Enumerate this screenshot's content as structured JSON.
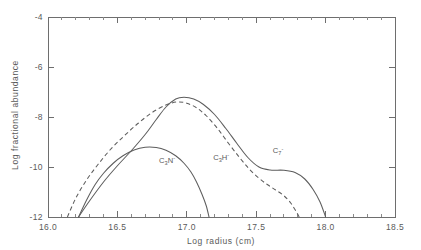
{
  "chart_data": {
    "type": "line",
    "title": "",
    "xlabel": "Log radius (cm)",
    "ylabel": "Log fractional abundance",
    "xlim": [
      16.0,
      18.5
    ],
    "ylim": [
      -12,
      -4
    ],
    "xticks": [
      "16.0",
      "16.5",
      "17.0",
      "17.5",
      "18.0",
      "18.5"
    ],
    "xtick_values": [
      16.0,
      16.5,
      17.0,
      17.5,
      18.0,
      18.5
    ],
    "yticks": [
      "-4",
      "-6",
      "-8",
      "-10",
      "-12"
    ],
    "ytick_values": [
      -4,
      -6,
      -8,
      -10,
      -12
    ],
    "grid": false,
    "legend_position": "inline-annotations",
    "series": [
      {
        "name": "C7-",
        "label_base": "C",
        "label_sub": "7",
        "label_sup": "-",
        "style": "solid",
        "color": "#5d5d5d",
        "annotation_x": 17.62,
        "annotation_y": -9.45,
        "points": [
          [
            16.22,
            -12.0
          ],
          [
            16.3,
            -11.35
          ],
          [
            16.4,
            -10.6
          ],
          [
            16.5,
            -9.95
          ],
          [
            16.6,
            -9.35
          ],
          [
            16.7,
            -8.7
          ],
          [
            16.78,
            -8.1
          ],
          [
            16.85,
            -7.6
          ],
          [
            16.92,
            -7.28
          ],
          [
            16.98,
            -7.21
          ],
          [
            17.05,
            -7.28
          ],
          [
            17.12,
            -7.5
          ],
          [
            17.2,
            -7.9
          ],
          [
            17.28,
            -8.45
          ],
          [
            17.36,
            -9.05
          ],
          [
            17.44,
            -9.62
          ],
          [
            17.52,
            -10.0
          ],
          [
            17.6,
            -10.12
          ],
          [
            17.7,
            -10.13
          ],
          [
            17.78,
            -10.22
          ],
          [
            17.85,
            -10.48
          ],
          [
            17.91,
            -10.9
          ],
          [
            17.96,
            -11.4
          ],
          [
            18.0,
            -12.0
          ]
        ]
      },
      {
        "name": "C3H-",
        "label_base": "C",
        "label_sub": "3",
        "label_sup": "-",
        "label_mid": "H",
        "style": "dashed",
        "color": "#5d5d5d",
        "annotation_x": 17.19,
        "annotation_y": -9.72,
        "points": [
          [
            16.14,
            -12.0
          ],
          [
            16.2,
            -11.25
          ],
          [
            16.28,
            -10.5
          ],
          [
            16.36,
            -9.9
          ],
          [
            16.45,
            -9.3
          ],
          [
            16.55,
            -8.75
          ],
          [
            16.65,
            -8.25
          ],
          [
            16.75,
            -7.82
          ],
          [
            16.85,
            -7.52
          ],
          [
            16.93,
            -7.4
          ],
          [
            17.0,
            -7.45
          ],
          [
            17.07,
            -7.63
          ],
          [
            17.14,
            -7.95
          ],
          [
            17.22,
            -8.45
          ],
          [
            17.3,
            -9.05
          ],
          [
            17.38,
            -9.62
          ],
          [
            17.45,
            -10.08
          ],
          [
            17.52,
            -10.45
          ],
          [
            17.58,
            -10.7
          ],
          [
            17.64,
            -10.92
          ],
          [
            17.7,
            -11.15
          ],
          [
            17.75,
            -11.45
          ],
          [
            17.79,
            -11.8
          ],
          [
            17.81,
            -12.0
          ]
        ]
      },
      {
        "name": "C3N-",
        "label_base": "C",
        "label_sub": "3",
        "label_sup": "-",
        "label_mid": "N",
        "style": "solid",
        "color": "#5d5d5d",
        "annotation_x": 16.8,
        "annotation_y": -9.82,
        "points": [
          [
            16.22,
            -12.0
          ],
          [
            16.28,
            -11.3
          ],
          [
            16.34,
            -10.7
          ],
          [
            16.4,
            -10.25
          ],
          [
            16.47,
            -9.85
          ],
          [
            16.54,
            -9.55
          ],
          [
            16.62,
            -9.32
          ],
          [
            16.7,
            -9.21
          ],
          [
            16.78,
            -9.22
          ],
          [
            16.85,
            -9.33
          ],
          [
            16.92,
            -9.55
          ],
          [
            16.98,
            -9.85
          ],
          [
            17.03,
            -10.2
          ],
          [
            17.07,
            -10.6
          ],
          [
            17.11,
            -11.1
          ],
          [
            17.14,
            -11.55
          ],
          [
            17.16,
            -12.0
          ]
        ]
      }
    ]
  }
}
